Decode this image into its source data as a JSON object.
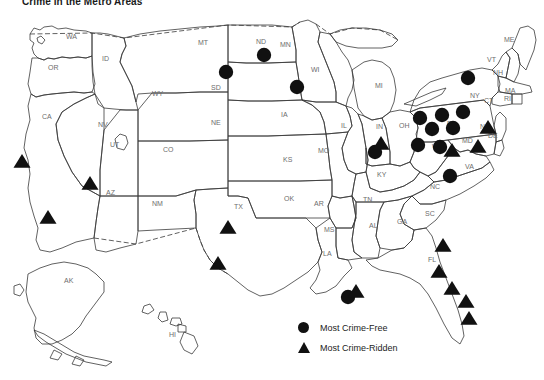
{
  "title": "Crime in the Metro Areas",
  "legend": {
    "items": [
      {
        "marker": "circle-marker",
        "label": "Most Crime-Free"
      },
      {
        "marker": "triangle-marker",
        "label": "Most Crime-Ridden"
      }
    ]
  },
  "colors": {
    "marker": "#111111",
    "outline": "#3a3a3a",
    "state_label": "#6d6d6d",
    "background": "#ffffff",
    "title": "#1a1a1a"
  },
  "map": {
    "kind": "choropleth-free-point-map",
    "region": "United States",
    "state_labels": [
      {
        "abbr": "WA",
        "x": 66,
        "y": 39
      },
      {
        "abbr": "OR",
        "x": 48,
        "y": 70
      },
      {
        "abbr": "ID",
        "x": 102,
        "y": 61
      },
      {
        "abbr": "MT",
        "x": 198,
        "y": 45
      },
      {
        "abbr": "ND",
        "x": 256,
        "y": 44
      },
      {
        "abbr": "MN",
        "x": 280,
        "y": 47
      },
      {
        "abbr": "WI",
        "x": 311,
        "y": 72
      },
      {
        "abbr": "MI",
        "x": 375,
        "y": 88
      },
      {
        "abbr": "SD",
        "x": 211,
        "y": 90
      },
      {
        "abbr": "WY",
        "x": 152,
        "y": 96
      },
      {
        "abbr": "NE",
        "x": 211,
        "y": 125
      },
      {
        "abbr": "IA",
        "x": 281,
        "y": 117
      },
      {
        "abbr": "IL",
        "x": 341,
        "y": 128
      },
      {
        "abbr": "IN",
        "x": 376,
        "y": 129
      },
      {
        "abbr": "OH",
        "x": 399,
        "y": 128
      },
      {
        "abbr": "CA",
        "x": 42,
        "y": 119
      },
      {
        "abbr": "NV",
        "x": 98,
        "y": 127
      },
      {
        "abbr": "UT",
        "x": 110,
        "y": 147
      },
      {
        "abbr": "CO",
        "x": 163,
        "y": 152
      },
      {
        "abbr": "KS",
        "x": 283,
        "y": 162
      },
      {
        "abbr": "MO",
        "x": 318,
        "y": 153
      },
      {
        "abbr": "KY",
        "x": 377,
        "y": 177
      },
      {
        "abbr": "AZ",
        "x": 106,
        "y": 195
      },
      {
        "abbr": "NM",
        "x": 152,
        "y": 206
      },
      {
        "abbr": "TX",
        "x": 234,
        "y": 209
      },
      {
        "abbr": "OK",
        "x": 284,
        "y": 201
      },
      {
        "abbr": "AR",
        "x": 314,
        "y": 206
      },
      {
        "abbr": "TN",
        "x": 363,
        "y": 202
      },
      {
        "abbr": "MS",
        "x": 324,
        "y": 232
      },
      {
        "abbr": "AL",
        "x": 369,
        "y": 228
      },
      {
        "abbr": "GA",
        "x": 397,
        "y": 224
      },
      {
        "abbr": "SC",
        "x": 425,
        "y": 216
      },
      {
        "abbr": "NC",
        "x": 430,
        "y": 189
      },
      {
        "abbr": "VA",
        "x": 465,
        "y": 169
      },
      {
        "abbr": "WV",
        "x": 432,
        "y": 149
      },
      {
        "abbr": "MD",
        "x": 462,
        "y": 143
      },
      {
        "abbr": "DE",
        "x": 488,
        "y": 138
      },
      {
        "abbr": "PA",
        "x": 447,
        "y": 126
      },
      {
        "abbr": "NJ",
        "x": 480,
        "y": 129
      },
      {
        "abbr": "NY",
        "x": 470,
        "y": 98
      },
      {
        "abbr": "CT",
        "x": 484,
        "y": 103
      },
      {
        "abbr": "RI",
        "x": 504,
        "y": 101
      },
      {
        "abbr": "MA",
        "x": 505,
        "y": 93
      },
      {
        "abbr": "VT",
        "x": 487,
        "y": 62
      },
      {
        "abbr": "NH",
        "x": 493,
        "y": 75
      },
      {
        "abbr": "ME",
        "x": 504,
        "y": 42
      },
      {
        "abbr": "LA",
        "x": 323,
        "y": 256
      },
      {
        "abbr": "FL",
        "x": 428,
        "y": 262
      },
      {
        "abbr": "AK",
        "x": 64,
        "y": 283
      },
      {
        "abbr": "HI",
        "x": 169,
        "y": 337
      }
    ],
    "markers": {
      "crime_free_circles": [
        {
          "x": 226,
          "y": 72
        },
        {
          "x": 264,
          "y": 55
        },
        {
          "x": 297,
          "y": 87
        },
        {
          "x": 375,
          "y": 152
        },
        {
          "x": 468,
          "y": 78
        },
        {
          "x": 420,
          "y": 118
        },
        {
          "x": 442,
          "y": 115
        },
        {
          "x": 463,
          "y": 112
        },
        {
          "x": 432,
          "y": 129
        },
        {
          "x": 453,
          "y": 128
        },
        {
          "x": 418,
          "y": 145
        },
        {
          "x": 440,
          "y": 147
        },
        {
          "x": 450,
          "y": 176
        },
        {
          "x": 348,
          "y": 297
        }
      ],
      "crime_ridden_triangles": [
        {
          "x": 22,
          "y": 162
        },
        {
          "x": 90,
          "y": 184
        },
        {
          "x": 48,
          "y": 218
        },
        {
          "x": 228,
          "y": 228
        },
        {
          "x": 218,
          "y": 264
        },
        {
          "x": 381,
          "y": 144
        },
        {
          "x": 488,
          "y": 128
        },
        {
          "x": 478,
          "y": 147
        },
        {
          "x": 452,
          "y": 151
        },
        {
          "x": 356,
          "y": 292
        },
        {
          "x": 443,
          "y": 246
        },
        {
          "x": 439,
          "y": 272
        },
        {
          "x": 452,
          "y": 289
        },
        {
          "x": 466,
          "y": 302
        },
        {
          "x": 469,
          "y": 319
        }
      ]
    }
  }
}
